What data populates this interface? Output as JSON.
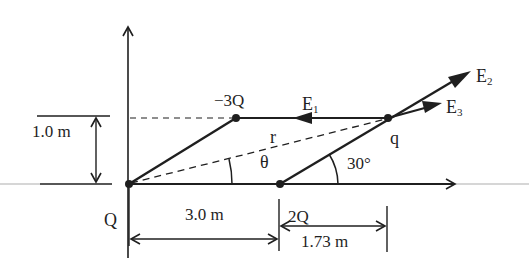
{
  "diagram": {
    "title": "",
    "charges": [
      {
        "id": "Q",
        "label": "Q",
        "position_m": [
          0,
          0
        ]
      },
      {
        "id": "minus3Q",
        "label": "−3Q",
        "position_m": [
          1.73,
          1.0
        ]
      },
      {
        "id": "2Q",
        "label": "2Q",
        "position_m": [
          3.0,
          0
        ]
      },
      {
        "id": "q",
        "label": "q",
        "position_m": [
          4.73,
          1.0
        ]
      }
    ],
    "vectors": [
      {
        "id": "E1",
        "label": "E",
        "subscript": "1",
        "direction": "left (from q toward −3Q line)"
      },
      {
        "id": "E2",
        "label": "E",
        "subscript": "2",
        "direction": "along 30° line, away from 2Q"
      },
      {
        "id": "E3",
        "label": "E",
        "subscript": "3",
        "direction": "along r, away from Q"
      }
    ],
    "labels": {
      "r": "r",
      "theta": "θ",
      "angle_30": "30°",
      "dim_height": "1.0 m",
      "dim_3m": "3.0 m",
      "dim_173m": "1.73 m"
    },
    "colors": {
      "ink": "#1f1f1f",
      "axis_faint": "#c8c8c8",
      "background": "#ffffff"
    }
  }
}
